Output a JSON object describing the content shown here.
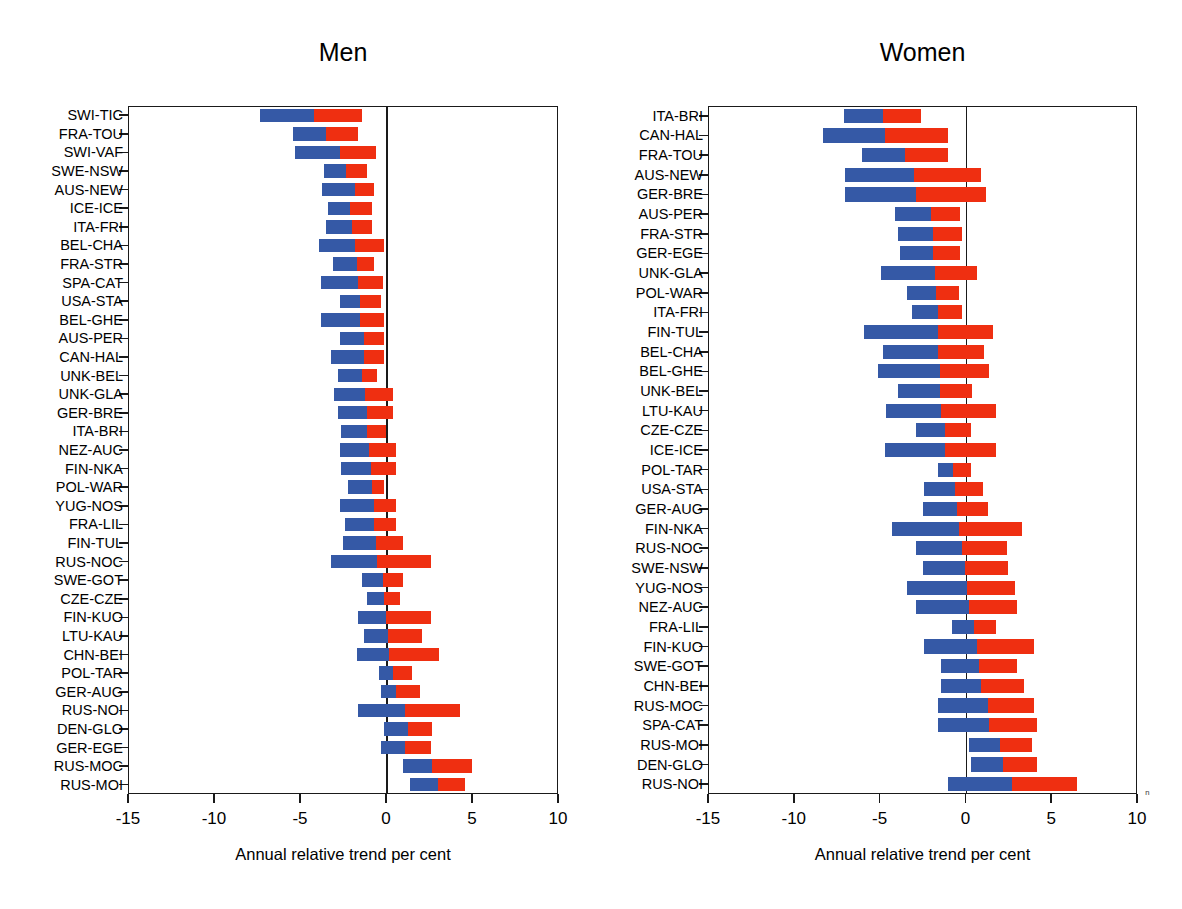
{
  "figure": {
    "cut_off_header": "",
    "xlabel": "Annual relative trend per cent",
    "xticks": [
      "-15",
      "-10",
      "-5",
      "0",
      "5",
      "10"
    ],
    "xlim": [
      -15,
      10
    ],
    "colors": {
      "blue": "#3559a6",
      "red": "#ef2f11",
      "axis": "#1a1a1a"
    }
  },
  "panels": [
    {
      "id": "men",
      "title": "Men"
    },
    {
      "id": "women",
      "title": "Women"
    }
  ],
  "chart_data": [
    {
      "type": "bar",
      "orientation": "horizontal",
      "stacked": true,
      "title": "Men",
      "xlabel": "Annual relative trend per cent",
      "ylabel": "",
      "xlim": [
        -15,
        10
      ],
      "xticks": [
        -15,
        -10,
        -5,
        0,
        5,
        10
      ],
      "grid": false,
      "legend": "none",
      "series": [
        {
          "name": "blue-segment",
          "color": "#3559a6"
        },
        {
          "name": "red-segment",
          "color": "#ef2f11"
        }
      ],
      "categories": [
        "SWI-TIC",
        "FRA-TOU",
        "SWI-VAF",
        "SWE-NSW",
        "AUS-NEW",
        "ICE-ICE",
        "ITA-FRI",
        "BEL-CHA",
        "FRA-STR",
        "SPA-CAT",
        "USA-STA",
        "BEL-GHE",
        "AUS-PER",
        "CAN-HAL",
        "UNK-BEL",
        "UNK-GLA",
        "GER-BRE",
        "ITA-BRI",
        "NEZ-AUC",
        "FIN-NKA",
        "POL-WAR",
        "YUG-NOS",
        "FRA-LIL",
        "FIN-TUL",
        "RUS-NOC",
        "SWE-GOT",
        "CZE-CZE",
        "FIN-KUO",
        "LTU-KAU",
        "CHN-BEI",
        "POL-TAR",
        "GER-AUG",
        "RUS-NOI",
        "DEN-GLO",
        "GER-EGE",
        "RUS-MOC",
        "RUS-MOI"
      ],
      "bars": [
        {
          "category": "SWI-TIC",
          "blue_start": -7.3,
          "blue_end": -4.2,
          "red_start": -4.2,
          "red_end": -1.4
        },
        {
          "category": "FRA-TOU",
          "blue_start": -5.4,
          "blue_end": -3.5,
          "red_start": -3.5,
          "red_end": -1.6
        },
        {
          "category": "SWI-VAF",
          "blue_start": -5.3,
          "blue_end": -2.7,
          "red_start": -2.7,
          "red_end": -0.6
        },
        {
          "category": "SWE-NSW",
          "blue_start": -3.6,
          "blue_end": -2.3,
          "red_start": -2.3,
          "red_end": -1.1
        },
        {
          "category": "AUS-NEW",
          "blue_start": -3.7,
          "blue_end": -1.8,
          "red_start": -1.8,
          "red_end": -0.7
        },
        {
          "category": "ICE-ICE",
          "blue_start": -3.4,
          "blue_end": -2.1,
          "red_start": -2.1,
          "red_end": -0.8
        },
        {
          "category": "ITA-FRI",
          "blue_start": -3.5,
          "blue_end": -2.0,
          "red_start": -2.0,
          "red_end": -0.8
        },
        {
          "category": "BEL-CHA",
          "blue_start": -3.9,
          "blue_end": -1.8,
          "red_start": -1.8,
          "red_end": -0.1
        },
        {
          "category": "FRA-STR",
          "blue_start": -3.1,
          "blue_end": -1.7,
          "red_start": -1.7,
          "red_end": -0.7
        },
        {
          "category": "SPA-CAT",
          "blue_start": -3.8,
          "blue_end": -1.6,
          "red_start": -1.6,
          "red_end": -0.2
        },
        {
          "category": "USA-STA",
          "blue_start": -2.7,
          "blue_end": -1.5,
          "red_start": -1.5,
          "red_end": -0.3
        },
        {
          "category": "BEL-GHE",
          "blue_start": -3.8,
          "blue_end": -1.5,
          "red_start": -1.5,
          "red_end": -0.1
        },
        {
          "category": "AUS-PER",
          "blue_start": -2.7,
          "blue_end": -1.3,
          "red_start": -1.3,
          "red_end": -0.1
        },
        {
          "category": "CAN-HAL",
          "blue_start": -3.2,
          "blue_end": -1.3,
          "red_start": -1.3,
          "red_end": -0.1
        },
        {
          "category": "UNK-BEL",
          "blue_start": -2.8,
          "blue_end": -1.4,
          "red_start": -1.4,
          "red_end": -0.5
        },
        {
          "category": "UNK-GLA",
          "blue_start": -3.0,
          "blue_end": -1.2,
          "red_start": -1.2,
          "red_end": 0.4
        },
        {
          "category": "GER-BRE",
          "blue_start": -2.8,
          "blue_end": -1.1,
          "red_start": -1.1,
          "red_end": 0.4
        },
        {
          "category": "ITA-BRI",
          "blue_start": -2.6,
          "blue_end": -1.1,
          "red_start": -1.1,
          "red_end": 0.0
        },
        {
          "category": "NEZ-AUC",
          "blue_start": -2.7,
          "blue_end": -1.0,
          "red_start": -1.0,
          "red_end": 0.6
        },
        {
          "category": "FIN-NKA",
          "blue_start": -2.6,
          "blue_end": -0.9,
          "red_start": -0.9,
          "red_end": 0.6
        },
        {
          "category": "POL-WAR",
          "blue_start": -2.2,
          "blue_end": -0.8,
          "red_start": -0.8,
          "red_end": -0.1
        },
        {
          "category": "YUG-NOS",
          "blue_start": -2.7,
          "blue_end": -0.7,
          "red_start": -0.7,
          "red_end": 0.6
        },
        {
          "category": "FRA-LIL",
          "blue_start": -2.4,
          "blue_end": -0.7,
          "red_start": -0.7,
          "red_end": 0.6
        },
        {
          "category": "FIN-TUL",
          "blue_start": -2.5,
          "blue_end": -0.6,
          "red_start": -0.6,
          "red_end": 1.0
        },
        {
          "category": "RUS-NOC",
          "blue_start": -3.2,
          "blue_end": -0.5,
          "red_start": -0.5,
          "red_end": 2.6
        },
        {
          "category": "SWE-GOT",
          "blue_start": -1.4,
          "blue_end": -0.2,
          "red_start": -0.2,
          "red_end": 1.0
        },
        {
          "category": "CZE-CZE",
          "blue_start": -1.1,
          "blue_end": -0.1,
          "red_start": -0.1,
          "red_end": 0.8
        },
        {
          "category": "FIN-KUO",
          "blue_start": -1.6,
          "blue_end": 0.0,
          "red_start": 0.0,
          "red_end": 2.6
        },
        {
          "category": "LTU-KAU",
          "blue_start": -1.3,
          "blue_end": 0.1,
          "red_start": 0.1,
          "red_end": 2.1
        },
        {
          "category": "CHN-BEI",
          "blue_start": -1.7,
          "blue_end": 0.2,
          "red_start": 0.2,
          "red_end": 3.1
        },
        {
          "category": "POL-TAR",
          "blue_start": -0.4,
          "blue_end": 0.4,
          "red_start": 0.4,
          "red_end": 1.5
        },
        {
          "category": "GER-AUG",
          "blue_start": -0.3,
          "blue_end": 0.6,
          "red_start": 0.6,
          "red_end": 2.0
        },
        {
          "category": "RUS-NOI",
          "blue_start": -1.6,
          "blue_end": 1.1,
          "red_start": 1.1,
          "red_end": 4.3
        },
        {
          "category": "DEN-GLO",
          "blue_start": -0.1,
          "blue_end": 1.3,
          "red_start": 1.3,
          "red_end": 2.7
        },
        {
          "category": "GER-EGE",
          "blue_start": -0.3,
          "blue_end": 1.1,
          "red_start": 1.1,
          "red_end": 2.6
        },
        {
          "category": "RUS-MOC",
          "blue_start": 1.0,
          "blue_end": 2.7,
          "red_start": 2.7,
          "red_end": 5.0
        },
        {
          "category": "RUS-MOI",
          "blue_start": 1.4,
          "blue_end": 3.0,
          "red_start": 3.0,
          "red_end": 4.6
        }
      ]
    },
    {
      "type": "bar",
      "orientation": "horizontal",
      "stacked": true,
      "title": "Women",
      "xlabel": "Annual relative trend per cent",
      "ylabel": "",
      "xlim": [
        -15,
        10
      ],
      "xticks": [
        -15,
        -10,
        -5,
        0,
        5,
        10
      ],
      "grid": false,
      "legend": "none",
      "series": [
        {
          "name": "blue-segment",
          "color": "#3559a6"
        },
        {
          "name": "red-segment",
          "color": "#ef2f11"
        }
      ],
      "categories": [
        "ITA-BRI",
        "CAN-HAL",
        "FRA-TOU",
        "AUS-NEW",
        "GER-BRE",
        "AUS-PER",
        "FRA-STR",
        "GER-EGE",
        "UNK-GLA",
        "POL-WAR",
        "ITA-FRI",
        "FIN-TUL",
        "BEL-CHA",
        "BEL-GHE",
        "UNK-BEL",
        "LTU-KAU",
        "CZE-CZE",
        "ICE-ICE",
        "POL-TAR",
        "USA-STA",
        "GER-AUG",
        "FIN-NKA",
        "RUS-NOC",
        "SWE-NSW",
        "YUG-NOS",
        "NEZ-AUC",
        "FRA-LIL",
        "FIN-KUO",
        "SWE-GOT",
        "CHN-BEI",
        "RUS-MOC",
        "SPA-CAT",
        "RUS-MOI",
        "DEN-GLO",
        "RUS-NOI"
      ],
      "bars": [
        {
          "category": "ITA-BRI",
          "blue_start": -7.1,
          "blue_end": -4.8,
          "red_start": -4.8,
          "red_end": -2.6
        },
        {
          "category": "CAN-HAL",
          "blue_start": -8.3,
          "blue_end": -4.7,
          "red_start": -4.7,
          "red_end": -1.0
        },
        {
          "category": "FRA-TOU",
          "blue_start": -6.0,
          "blue_end": -3.5,
          "red_start": -3.5,
          "red_end": -1.0
        },
        {
          "category": "AUS-NEW",
          "blue_start": -7.0,
          "blue_end": -3.0,
          "red_start": -3.0,
          "red_end": 0.9
        },
        {
          "category": "GER-BRE",
          "blue_start": -7.0,
          "blue_end": -2.9,
          "red_start": -2.9,
          "red_end": 1.2
        },
        {
          "category": "AUS-PER",
          "blue_start": -4.1,
          "blue_end": -2.0,
          "red_start": -2.0,
          "red_end": -0.3
        },
        {
          "category": "FRA-STR",
          "blue_start": -3.9,
          "blue_end": -1.9,
          "red_start": -1.9,
          "red_end": -0.2
        },
        {
          "category": "GER-EGE",
          "blue_start": -3.8,
          "blue_end": -1.9,
          "red_start": -1.9,
          "red_end": -0.3
        },
        {
          "category": "UNK-GLA",
          "blue_start": -4.9,
          "blue_end": -1.8,
          "red_start": -1.8,
          "red_end": 0.7
        },
        {
          "category": "POL-WAR",
          "blue_start": -3.4,
          "blue_end": -1.7,
          "red_start": -1.7,
          "red_end": -0.4
        },
        {
          "category": "ITA-FRI",
          "blue_start": -3.1,
          "blue_end": -1.6,
          "red_start": -1.6,
          "red_end": -0.2
        },
        {
          "category": "FIN-TUL",
          "blue_start": -5.9,
          "blue_end": -1.6,
          "red_start": -1.6,
          "red_end": 1.6
        },
        {
          "category": "BEL-CHA",
          "blue_start": -4.8,
          "blue_end": -1.6,
          "red_start": -1.6,
          "red_end": 1.1
        },
        {
          "category": "BEL-GHE",
          "blue_start": -5.1,
          "blue_end": -1.5,
          "red_start": -1.5,
          "red_end": 1.4
        },
        {
          "category": "UNK-BEL",
          "blue_start": -3.9,
          "blue_end": -1.5,
          "red_start": -1.5,
          "red_end": 0.4
        },
        {
          "category": "LTU-KAU",
          "blue_start": -4.6,
          "blue_end": -1.4,
          "red_start": -1.4,
          "red_end": 1.8
        },
        {
          "category": "CZE-CZE",
          "blue_start": -2.9,
          "blue_end": -1.2,
          "red_start": -1.2,
          "red_end": 0.3
        },
        {
          "category": "ICE-ICE",
          "blue_start": -4.7,
          "blue_end": -1.2,
          "red_start": -1.2,
          "red_end": 1.8
        },
        {
          "category": "POL-TAR",
          "blue_start": -1.6,
          "blue_end": -0.7,
          "red_start": -0.7,
          "red_end": 0.3
        },
        {
          "category": "USA-STA",
          "blue_start": -2.4,
          "blue_end": -0.6,
          "red_start": -0.6,
          "red_end": 1.0
        },
        {
          "category": "GER-AUG",
          "blue_start": -2.5,
          "blue_end": -0.5,
          "red_start": -0.5,
          "red_end": 1.3
        },
        {
          "category": "FIN-NKA",
          "blue_start": -4.3,
          "blue_end": -0.4,
          "red_start": -0.4,
          "red_end": 3.3
        },
        {
          "category": "RUS-NOC",
          "blue_start": -2.9,
          "blue_end": -0.2,
          "red_start": -0.2,
          "red_end": 2.4
        },
        {
          "category": "SWE-NSW",
          "blue_start": -2.5,
          "blue_end": 0.0,
          "red_start": 0.0,
          "red_end": 2.5
        },
        {
          "category": "YUG-NOS",
          "blue_start": -3.4,
          "blue_end": 0.1,
          "red_start": 0.1,
          "red_end": 2.9
        },
        {
          "category": "NEZ-AUC",
          "blue_start": -2.9,
          "blue_end": 0.2,
          "red_start": 0.2,
          "red_end": 3.0
        },
        {
          "category": "FRA-LIL",
          "blue_start": -0.8,
          "blue_end": 0.5,
          "red_start": 0.5,
          "red_end": 1.8
        },
        {
          "category": "FIN-KUO",
          "blue_start": -2.4,
          "blue_end": 0.7,
          "red_start": 0.7,
          "red_end": 4.0
        },
        {
          "category": "SWE-GOT",
          "blue_start": -1.4,
          "blue_end": 0.8,
          "red_start": 0.8,
          "red_end": 3.0
        },
        {
          "category": "CHN-BEI",
          "blue_start": -1.4,
          "blue_end": 0.9,
          "red_start": 0.9,
          "red_end": 3.4
        },
        {
          "category": "RUS-MOC",
          "blue_start": -1.6,
          "blue_end": 1.3,
          "red_start": 1.3,
          "red_end": 4.0
        },
        {
          "category": "SPA-CAT",
          "blue_start": -1.6,
          "blue_end": 1.4,
          "red_start": 1.4,
          "red_end": 4.2
        },
        {
          "category": "RUS-MOI",
          "blue_start": 0.2,
          "blue_end": 2.0,
          "red_start": 2.0,
          "red_end": 3.9
        },
        {
          "category": "DEN-GLO",
          "blue_start": 0.3,
          "blue_end": 2.2,
          "red_start": 2.2,
          "red_end": 4.2
        },
        {
          "category": "RUS-NOI",
          "blue_start": -1.0,
          "blue_end": 2.7,
          "red_start": 2.7,
          "red_end": 6.5
        }
      ]
    }
  ]
}
